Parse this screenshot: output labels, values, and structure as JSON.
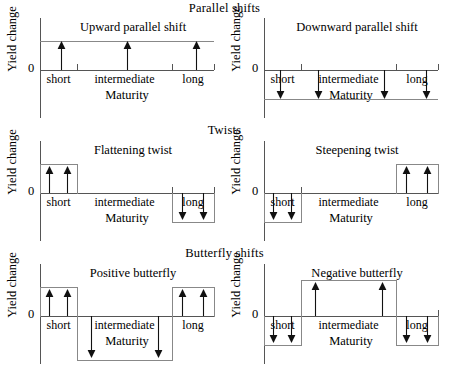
{
  "figure": {
    "axis_label": "Yield change",
    "zero_label": "0",
    "x_axis_label": "Maturity",
    "segments": [
      "short",
      "intermediate",
      "long"
    ]
  },
  "sections": [
    {
      "id": "parallel",
      "title": "Parallel shifts"
    },
    {
      "id": "twists",
      "title": "Twists"
    },
    {
      "id": "butterfly",
      "title": "Butterfly shifts"
    }
  ],
  "panels": [
    {
      "id": "upward-parallel-shift",
      "title": "Upward parallel shift",
      "section": "parallel",
      "shifts": {
        "short": "up",
        "intermediate": "up",
        "long": "up"
      }
    },
    {
      "id": "downward-parallel-shift",
      "title": "Downward parallel shift",
      "section": "parallel",
      "shifts": {
        "short": "down",
        "intermediate": "down",
        "long": "down"
      }
    },
    {
      "id": "flattening-twist",
      "title": "Flattening twist",
      "section": "twists",
      "shifts": {
        "short": "up",
        "intermediate": "none",
        "long": "down"
      }
    },
    {
      "id": "steepening-twist",
      "title": "Steepening twist",
      "section": "twists",
      "shifts": {
        "short": "down",
        "intermediate": "none",
        "long": "up"
      }
    },
    {
      "id": "positive-butterfly",
      "title": "Positive butterfly",
      "section": "butterfly",
      "shifts": {
        "short": "up",
        "intermediate": "down",
        "long": "up"
      }
    },
    {
      "id": "negative-butterfly",
      "title": "Negative butterfly",
      "section": "butterfly",
      "shifts": {
        "short": "down",
        "intermediate": "up",
        "long": "down"
      }
    }
  ]
}
